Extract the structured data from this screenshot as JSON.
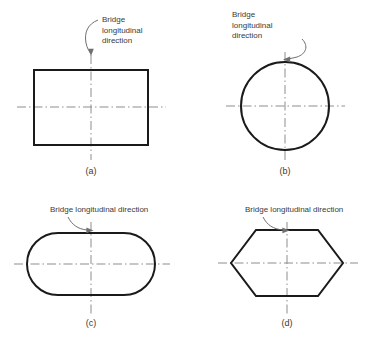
{
  "figure": {
    "background_color": "#ffffff",
    "outline_color": "#1a1a1a",
    "centerline_color": "#8d8d8d",
    "leader_color": "#6f6f6f",
    "text_color": "#3a3a3a"
  },
  "panels": [
    {
      "id": "a",
      "label": "(a)",
      "shape": "rectangle",
      "annotation_lines": [
        "Bridge",
        "longitudinal",
        "direction"
      ],
      "annotation_text": "Bridge longitudinal direction"
    },
    {
      "id": "b",
      "label": "(b)",
      "shape": "circle",
      "annotation_lines": [
        "Bridge",
        "longitudinal",
        "direction"
      ],
      "annotation_text": "Bridge longitudinal direction"
    },
    {
      "id": "c",
      "label": "(c)",
      "shape": "stadium",
      "annotation_lines": [
        "Bridge longitudinal direction"
      ],
      "annotation_text": "Bridge longitudinal direction"
    },
    {
      "id": "d",
      "label": "(d)",
      "shape": "hexagon",
      "annotation_lines": [
        "Bridge longitudinal direction"
      ],
      "annotation_text": "Bridge longitudinal direction"
    }
  ]
}
